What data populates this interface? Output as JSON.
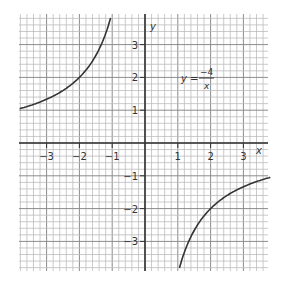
{
  "chart_data": {
    "type": "line",
    "title": "",
    "xlabel": "x",
    "ylabel": "y",
    "xlim": [
      -3.8,
      3.8
    ],
    "ylim": [
      -3.9,
      3.9
    ],
    "grid": true,
    "minor_divisions_per_unit": 5,
    "x_ticks": [
      -3,
      -2,
      -1,
      1,
      2,
      3
    ],
    "y_ticks": [
      3,
      2,
      1,
      -1,
      -2,
      -3
    ],
    "x_tick_labels": [
      "−3",
      "−2",
      "−1",
      "1",
      "2",
      "3"
    ],
    "y_tick_labels": [
      "3",
      "2",
      "1",
      "−1",
      "−2",
      "−3"
    ],
    "series": [
      {
        "name": "y = -4/x",
        "equation": "y = -4/x",
        "branches": [
          {
            "x": [
              -3.8,
              -3.5,
              -3,
              -2.5,
              -2,
              -1.5,
              -1.2,
              -1.05
            ],
            "y": [
              1.05,
              1.14,
              1.33,
              1.6,
              2,
              2.67,
              3.33,
              3.81
            ]
          },
          {
            "x": [
              1.05,
              1.2,
              1.5,
              2,
              2.5,
              3,
              3.5,
              3.8
            ],
            "y": [
              -3.81,
              -3.33,
              -2.67,
              -2,
              -1.6,
              -1.33,
              -1.14,
              -1.05
            ]
          }
        ]
      }
    ],
    "annotations": [
      {
        "text": "y = −4 / x",
        "at": [
          1.6,
          2
        ]
      }
    ]
  },
  "labels": {
    "x_axis": "x",
    "y_axis": "y",
    "eq_lhs": "y =",
    "eq_num": "−4",
    "eq_den": "x"
  },
  "colors": {
    "curve": "#333333",
    "axes": "#333333",
    "grid_major": "#8c8c8c",
    "grid_minor": "#bdbdbd"
  }
}
